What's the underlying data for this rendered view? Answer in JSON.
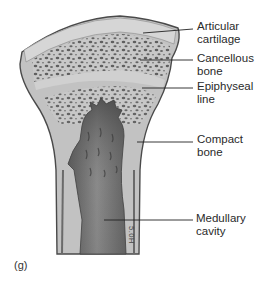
{
  "figure": {
    "panel_label": "(g)",
    "artist_initials": "5.0H",
    "colors": {
      "background": "#ffffff",
      "bone_outer": "#c4c4c4",
      "compact_bone": "#bdbdbd",
      "cartilage": "#d4d4d4",
      "outline": "#555555",
      "spongy_holes": "#5a5a5a",
      "medullary_dark": "#4c4c4c",
      "medullary_light": "#8a8a8a",
      "leader_line": "#222222"
    },
    "labels": [
      {
        "id": "articular-cartilage",
        "text": "Articular\ncartilage"
      },
      {
        "id": "cancellous-bone",
        "text": "Cancellous\nbone"
      },
      {
        "id": "epiphyseal-line",
        "text": "Epiphyseal\nline"
      },
      {
        "id": "compact-bone",
        "text": "Compact\nbone"
      },
      {
        "id": "medullary-cavity",
        "text": "Medullary\ncavity"
      }
    ]
  }
}
